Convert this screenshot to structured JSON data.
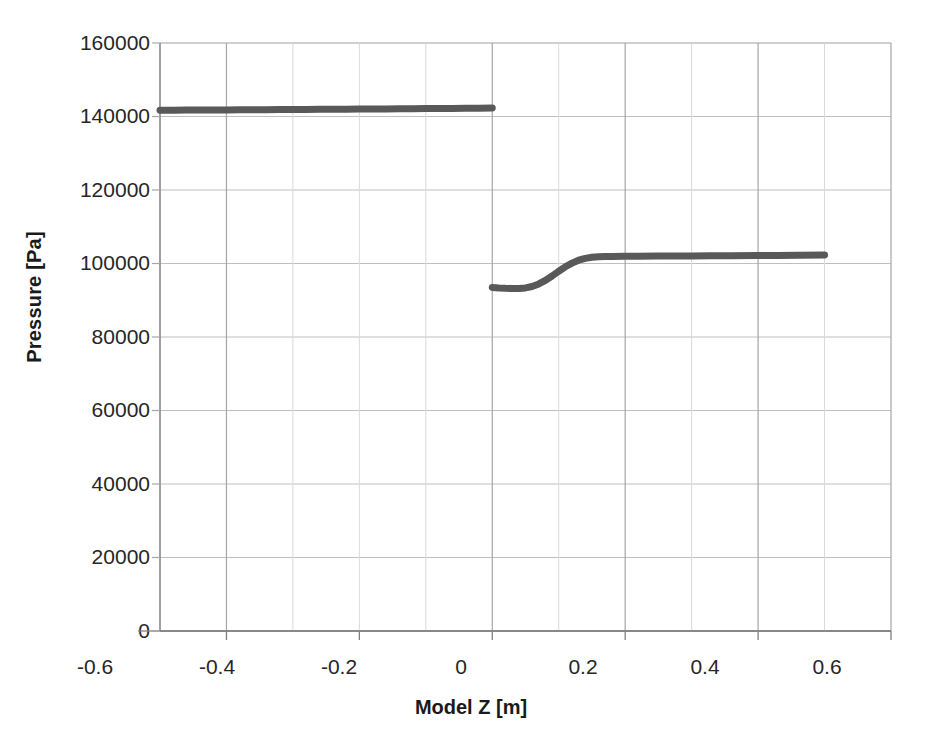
{
  "chart_data": {
    "type": "line",
    "title": "",
    "xlabel": "Model Z [m]",
    "ylabel": "Pressure [Pa]",
    "xlim": [
      -0.6,
      0.6
    ],
    "ylim": [
      0,
      160000
    ],
    "xticks": [
      "-0.6",
      "-0.4",
      "-0.2",
      "0",
      "0.2",
      "0.4",
      "0.6"
    ],
    "xtick_values": [
      -0.6,
      -0.4,
      -0.2,
      0,
      0.2,
      0.4,
      0.6
    ],
    "yticks": [
      "0",
      "20000",
      "40000",
      "60000",
      "80000",
      "100000",
      "120000",
      "140000",
      "160000"
    ],
    "ytick_values": [
      0,
      20000,
      40000,
      60000,
      80000,
      100000,
      120000,
      140000,
      160000
    ],
    "grid": true,
    "legend": "none",
    "line_color": "#595959",
    "line_width": 7,
    "series": [
      {
        "name": "Pressure upstream branch",
        "x": [
          -0.5,
          -0.48,
          -0.46,
          -0.44,
          -0.42,
          -0.4,
          -0.38,
          -0.36,
          -0.34,
          -0.32,
          -0.3,
          -0.28,
          -0.26,
          -0.24,
          -0.22,
          -0.2,
          -0.18,
          -0.16,
          -0.14,
          -0.12,
          -0.1,
          -0.08,
          -0.06,
          -0.04,
          -0.02,
          0.0
        ],
        "y": [
          141700,
          141720,
          141740,
          141760,
          141780,
          141800,
          141820,
          141840,
          141860,
          141880,
          141900,
          141920,
          141945,
          141970,
          141995,
          142020,
          142045,
          142070,
          142095,
          142120,
          142145,
          142170,
          142200,
          142230,
          142265,
          142300
        ]
      },
      {
        "name": "Pressure downstream branch",
        "x": [
          0.0,
          0.01,
          0.02,
          0.03,
          0.04,
          0.05,
          0.06,
          0.07,
          0.08,
          0.09,
          0.1,
          0.11,
          0.12,
          0.13,
          0.14,
          0.15,
          0.16,
          0.17,
          0.18,
          0.2,
          0.22,
          0.25,
          0.28,
          0.3,
          0.33,
          0.36,
          0.4,
          0.43,
          0.46,
          0.5
        ],
        "y": [
          93500,
          93350,
          93250,
          93200,
          93200,
          93350,
          93750,
          94450,
          95400,
          96600,
          97900,
          99100,
          100100,
          100900,
          101400,
          101700,
          101850,
          101900,
          101930,
          101960,
          101990,
          102020,
          102050,
          102070,
          102100,
          102130,
          102170,
          102200,
          102240,
          102300
        ]
      }
    ],
    "annotations": [
      {
        "text": "Discontinuity in pressure at Model Z = 0 m"
      }
    ]
  }
}
